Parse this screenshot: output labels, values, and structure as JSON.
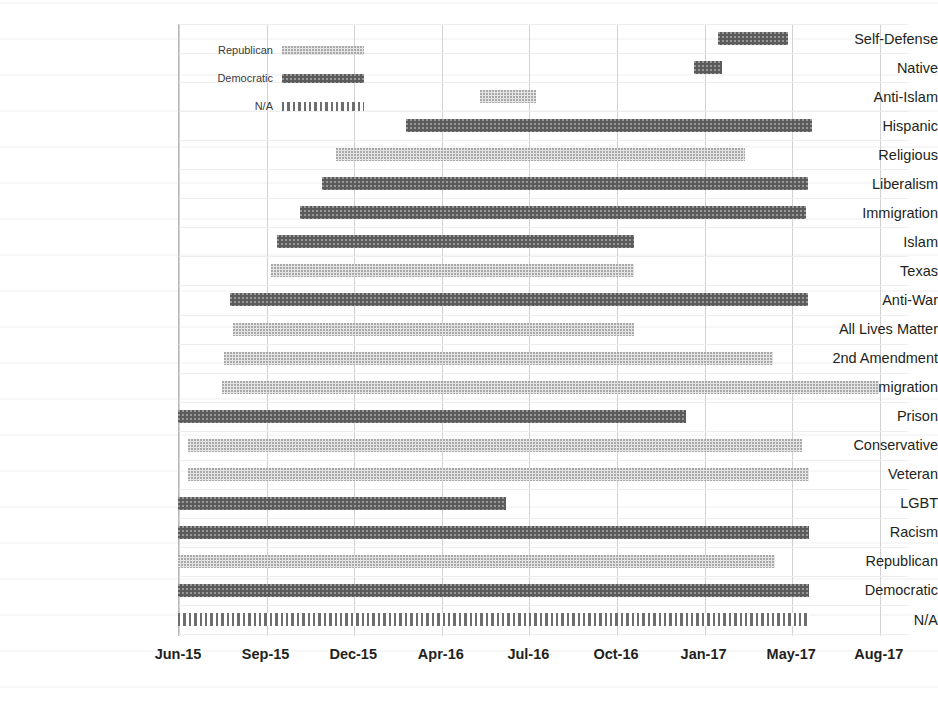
{
  "chart_data": {
    "type": "bar",
    "subtype": "gantt-timeline",
    "title": "",
    "xlabel": "",
    "ylabel": "",
    "grid": true,
    "legend_position": "top-left-inside",
    "axis": {
      "tick_labels": [
        "Jun-15",
        "Sep-15",
        "Dec-15",
        "Apr-16",
        "Jul-16",
        "Oct-16",
        "Jan-17",
        "May-17",
        "Aug-17"
      ],
      "tick_positions": [
        0,
        1,
        2,
        3,
        4,
        5,
        6,
        7,
        8
      ],
      "xlim": [
        0,
        8
      ]
    },
    "legend": [
      {
        "label": "Republican",
        "series": "rep",
        "color": "#e4e4e4",
        "pattern": "fine-dots"
      },
      {
        "label": "Democratic",
        "series": "dem",
        "color": "#5b5b5b",
        "pattern": "solid-dark"
      },
      {
        "label": "N/A",
        "series": "na",
        "color": "#6e6e6e",
        "pattern": "vertical-stripes"
      }
    ],
    "categories": [
      "Self-Defense",
      "Native",
      "Anti-Islam",
      "Hispanic",
      "Religious",
      "Liberalism",
      "Immigration",
      "Islam",
      "Texas",
      "Anti-War",
      "All Lives Matter",
      "2nd Amendment",
      "Anti-Immigration",
      "Prison",
      "Conservative",
      "Veteran",
      "LGBT",
      "Racism",
      "Republican",
      "Democratic",
      "N/A"
    ],
    "bars": [
      {
        "category": "Self-Defense",
        "series": "dem",
        "start": 6.17,
        "end": 6.96
      },
      {
        "category": "Native",
        "series": "dem",
        "start": 5.89,
        "end": 6.21
      },
      {
        "category": "Anti-Islam",
        "series": "rep",
        "start": 3.45,
        "end": 4.09
      },
      {
        "category": "Hispanic",
        "series": "dem",
        "start": 2.6,
        "end": 7.24
      },
      {
        "category": "Religious",
        "series": "rep",
        "start": 1.8,
        "end": 6.47
      },
      {
        "category": "Liberalism",
        "series": "dem",
        "start": 1.64,
        "end": 7.19
      },
      {
        "category": "Immigration",
        "series": "dem",
        "start": 1.39,
        "end": 7.17
      },
      {
        "category": "Islam",
        "series": "dem",
        "start": 1.13,
        "end": 5.21
      },
      {
        "category": "Texas",
        "series": "rep",
        "start": 1.06,
        "end": 5.21
      },
      {
        "category": "Anti-War",
        "series": "dem",
        "start": 0.59,
        "end": 7.19
      },
      {
        "category": "All Lives Matter",
        "series": "rep",
        "start": 0.63,
        "end": 5.2
      },
      {
        "category": "2nd Amendment",
        "series": "rep",
        "start": 0.53,
        "end": 6.79
      },
      {
        "category": "Anti-Immigration",
        "series": "rep",
        "start": 0.5,
        "end": 8.0
      },
      {
        "category": "Prison",
        "series": "dem",
        "start": 0.0,
        "end": 5.8
      },
      {
        "category": "Conservative",
        "series": "rep",
        "start": 0.11,
        "end": 7.12
      },
      {
        "category": "Veteran",
        "series": "rep",
        "start": 0.11,
        "end": 7.2
      },
      {
        "category": "LGBT",
        "series": "dem",
        "start": 0.0,
        "end": 3.74
      },
      {
        "category": "Racism",
        "series": "dem",
        "start": 0.0,
        "end": 7.2
      },
      {
        "category": "Republican",
        "series": "rep",
        "start": 0.0,
        "end": 6.81
      },
      {
        "category": "Democratic",
        "series": "dem",
        "start": 0.0,
        "end": 7.2
      },
      {
        "category": "N/A",
        "series": "na",
        "start": 0.0,
        "end": 7.2
      }
    ]
  }
}
